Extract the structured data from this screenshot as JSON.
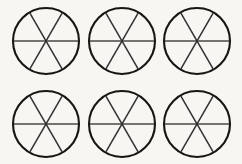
{
  "figure": {
    "background_color": "#f7f6f3",
    "outline_color": "#191512",
    "divider_color": "#333030",
    "horizontal_divider_color": "#4a4644",
    "rows": 2,
    "columns": 3,
    "circle_count": 6,
    "sectors_per_circle": 6,
    "divider_count_per_circle": 3,
    "divider_angles_degrees": [
      0,
      60,
      120
    ],
    "circles": [
      {
        "label": "circle-1",
        "row": 1,
        "column": 1,
        "center_x": 46,
        "center_y": 41,
        "radius": 33,
        "sectors": 6,
        "shaded_sectors": 0
      },
      {
        "label": "circle-2",
        "row": 1,
        "column": 2,
        "center_x": 122,
        "center_y": 41,
        "radius": 33,
        "sectors": 6,
        "shaded_sectors": 0
      },
      {
        "label": "circle-3",
        "row": 1,
        "column": 3,
        "center_x": 197,
        "center_y": 41,
        "radius": 33,
        "sectors": 6,
        "shaded_sectors": 0
      },
      {
        "label": "circle-4",
        "row": 2,
        "column": 1,
        "center_x": 46,
        "center_y": 124,
        "radius": 33,
        "sectors": 6,
        "shaded_sectors": 0
      },
      {
        "label": "circle-5",
        "row": 2,
        "column": 2,
        "center_x": 122,
        "center_y": 124,
        "radius": 33,
        "sectors": 6,
        "shaded_sectors": 0
      },
      {
        "label": "circle-6",
        "row": 2,
        "column": 3,
        "center_x": 197,
        "center_y": 124,
        "radius": 33,
        "sectors": 6,
        "shaded_sectors": 0
      }
    ]
  }
}
